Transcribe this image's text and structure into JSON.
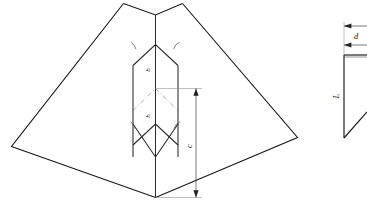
{
  "figure": {
    "background_color": "#ffffff",
    "line_color": "#1a1a1a",
    "width": 367,
    "height": 207
  },
  "labels": {
    "dimension_c": "c",
    "dimension_d": "d",
    "dimension_L": "L",
    "fold_upper": "b",
    "fold_lower": "b",
    "leader_top_left": "a",
    "leader_top_right": "a",
    "leader_bottom_left": "a",
    "leader_bottom_right": "a"
  },
  "views": {
    "main": {
      "name": "isometric-panel-view",
      "caption": ""
    },
    "detail": {
      "name": "section-detail-view",
      "caption": ""
    }
  },
  "annotations": {
    "c_description": "overall vertical height dimension",
    "d_description": "thickness dimension of section detail",
    "L_description": "vertical length of section detail"
  }
}
